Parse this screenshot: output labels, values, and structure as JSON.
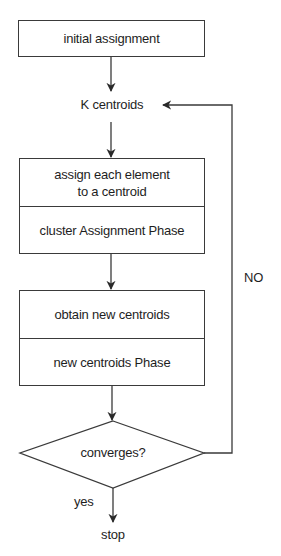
{
  "diagram": {
    "type": "flowchart",
    "nodes": {
      "initial": {
        "label": "initial assignment",
        "shape": "rectangle"
      },
      "centroids": {
        "label": "K centroids",
        "shape": "text"
      },
      "assign": {
        "shape": "rectangle-split",
        "top_label_line1": "assign each element",
        "top_label_line2": "to a centroid",
        "bottom_label": "cluster Assignment Phase"
      },
      "update": {
        "shape": "rectangle-split",
        "top_label": "obtain new centroids",
        "bottom_label": "new centroids Phase"
      },
      "decision": {
        "label": "converges?",
        "shape": "diamond"
      },
      "stop": {
        "label": "stop",
        "shape": "text"
      }
    },
    "edges": [
      {
        "from": "initial",
        "to": "centroids",
        "label": ""
      },
      {
        "from": "centroids",
        "to": "assign",
        "label": ""
      },
      {
        "from": "assign",
        "to": "update",
        "label": ""
      },
      {
        "from": "update",
        "to": "decision",
        "label": ""
      },
      {
        "from": "decision",
        "to": "stop",
        "label": "yes"
      },
      {
        "from": "decision",
        "to": "centroids",
        "label": "NO"
      }
    ],
    "edge_labels": {
      "yes": "yes",
      "no": "NO"
    },
    "colors": {
      "stroke": "#3a3a3a",
      "text": "#1e1e1e",
      "background": "#ffffff"
    }
  }
}
